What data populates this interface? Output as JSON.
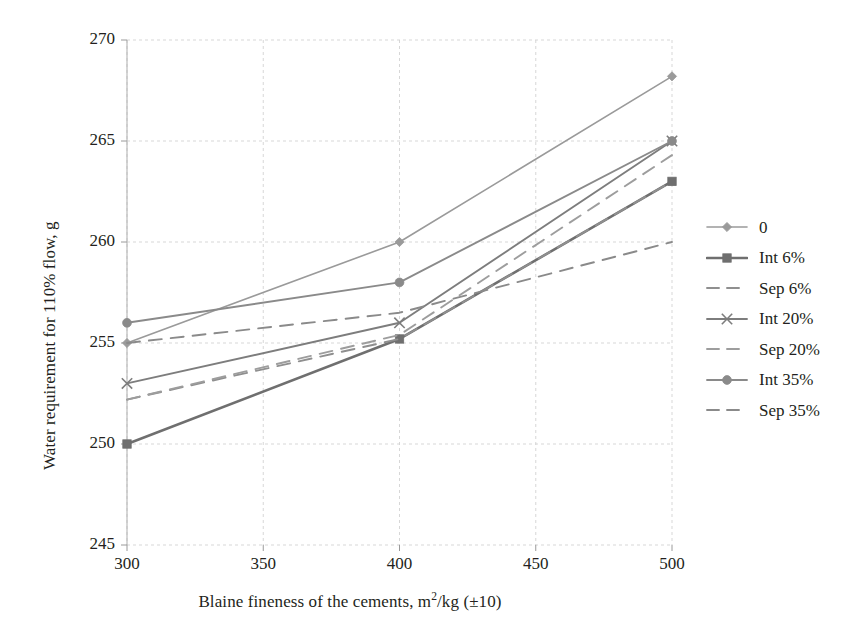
{
  "chart_data": {
    "type": "line",
    "title": "",
    "xlabel": "Blaine fineness of the cements, m2/kg (±10)",
    "xlabel_parts": {
      "pre": "Blaine fineness of the cements, m",
      "sup": "2",
      "post": "/kg (±10)"
    },
    "ylabel": "Water requirement for 110% flow, g",
    "x": [
      300,
      400,
      500
    ],
    "xlim": [
      300,
      500
    ],
    "ylim": [
      245,
      270
    ],
    "xticks": [
      "300",
      "350",
      "400",
      "450",
      "500"
    ],
    "xtick_values": [
      300,
      350,
      400,
      450,
      500
    ],
    "yticks": [
      "245",
      "250",
      "255",
      "260",
      "265",
      "270"
    ],
    "ytick_values": [
      245,
      250,
      255,
      260,
      265,
      270
    ],
    "grid": true,
    "legend_position": "right",
    "series": [
      {
        "name": "0",
        "values": [
          255.0,
          260.0,
          268.2
        ],
        "marker": "diamond",
        "dash": "solid",
        "color": "#9a9a9a",
        "width": 1.6
      },
      {
        "name": "Int 6%",
        "values": [
          250.0,
          255.2,
          263.0
        ],
        "marker": "square",
        "dash": "solid",
        "color": "#6f6f6f",
        "width": 2.6
      },
      {
        "name": "Sep 6%",
        "values": [
          252.2,
          255.2,
          263.0
        ],
        "marker": "none",
        "dash": "dashed",
        "color": "#8f8f8f",
        "width": 1.9
      },
      {
        "name": "Int 20%",
        "values": [
          253.0,
          256.0,
          265.0
        ],
        "marker": "cross",
        "dash": "solid",
        "color": "#7d7d7d",
        "width": 1.9
      },
      {
        "name": "Sep 20%",
        "values": [
          252.2,
          255.4,
          264.3
        ],
        "marker": "none",
        "dash": "dashed",
        "color": "#9d9d9d",
        "width": 1.9
      },
      {
        "name": "Int 35%",
        "values": [
          256.0,
          258.0,
          265.0
        ],
        "marker": "circle",
        "dash": "solid",
        "color": "#8a8a8a",
        "width": 1.9
      },
      {
        "name": "Sep 35%",
        "values": [
          255.0,
          256.5,
          260.0
        ],
        "marker": "none",
        "dash": "dashed",
        "color": "#8a8a8a",
        "width": 1.9
      }
    ]
  },
  "legend": {
    "items": [
      {
        "label": "0"
      },
      {
        "label": "Int 6%"
      },
      {
        "label": "Sep 6%"
      },
      {
        "label": "Int 20%"
      },
      {
        "label": "Sep 20%"
      },
      {
        "label": "Int 35%"
      },
      {
        "label": "Sep 35%"
      }
    ]
  }
}
